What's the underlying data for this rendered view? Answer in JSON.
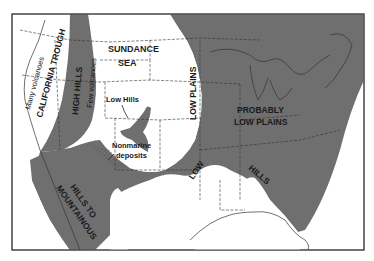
{
  "map": {
    "colors": {
      "land_highland": "#6f6f6f",
      "sea_lowland": "#ffffff",
      "frame": "#444444",
      "text": "#1a1a1a"
    },
    "labels": {
      "california_trough": "CALIFORNIA TROUGH",
      "many_volcanoes": "Many volcanoes",
      "high_hills": "HIGH HILLS",
      "few_volcanoes": "Few volcanoes",
      "sundance": "SUNDANCE",
      "sea": "SEA",
      "low_hills": "Low Hills",
      "nonmarine": "Nonmarine",
      "deposits": "deposits",
      "low_plains": "LOW PLAINS",
      "probably": "PROBABLY",
      "probably_low_plains": "LOW PLAINS",
      "low": "LOW",
      "hills": "HILLS",
      "hills_to": "HILLS TO",
      "mountainous": "MOUNTAINOUS"
    }
  }
}
